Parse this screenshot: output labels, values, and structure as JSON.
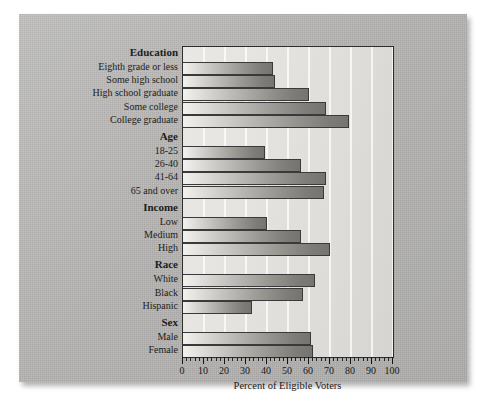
{
  "chart_data": {
    "type": "bar",
    "orientation": "horizontal",
    "title": "",
    "xlabel": "Percent of Eligible Voters",
    "ylabel": "",
    "xlim": [
      0,
      100
    ],
    "xticks": [
      0,
      10,
      20,
      30,
      40,
      50,
      60,
      70,
      80,
      90,
      100
    ],
    "xtick_labels": [
      "0",
      "10",
      "20",
      "30",
      "40",
      "50",
      "60",
      "70",
      "80",
      "90",
      "100"
    ],
    "minor_tick_step": 2,
    "grid": true,
    "grid_axis": "x",
    "legend": null,
    "groups": [
      {
        "name": "Education",
        "categories": [
          "Eighth grade or less",
          "Some high school",
          "High school graduate",
          "Some college",
          "College graduate"
        ],
        "values": [
          43,
          44,
          60,
          68,
          79
        ]
      },
      {
        "name": "Age",
        "categories": [
          "18-25",
          "26-40",
          "41-64",
          "65 and over"
        ],
        "values": [
          39,
          56,
          68,
          67
        ]
      },
      {
        "name": "Income",
        "categories": [
          "Low",
          "Medium",
          "High"
        ],
        "values": [
          40,
          56,
          70
        ]
      },
      {
        "name": "Race",
        "categories": [
          "White",
          "Black",
          "Hispanic"
        ],
        "values": [
          63,
          57,
          33
        ]
      },
      {
        "name": "Sex",
        "categories": [
          "Male",
          "Female"
        ],
        "values": [
          61,
          62
        ]
      }
    ],
    "categories": [
      "Eighth grade or less",
      "Some high school",
      "High school graduate",
      "Some college",
      "College graduate",
      "18-25",
      "26-40",
      "41-64",
      "65 and over",
      "Low",
      "Medium",
      "High",
      "White",
      "Black",
      "Hispanic",
      "Male",
      "Female"
    ],
    "values": [
      43,
      44,
      60,
      68,
      79,
      39,
      56,
      68,
      67,
      40,
      56,
      70,
      63,
      57,
      33,
      61,
      62
    ]
  },
  "colors": {
    "panel_background": "#b7b6b4",
    "plot_background": "#e6e5e1",
    "bar_light": "#f2f1ee",
    "bar_dark": "#76746f",
    "axis": "#232323",
    "text": "#18181a",
    "gridline": "#ffffff"
  }
}
